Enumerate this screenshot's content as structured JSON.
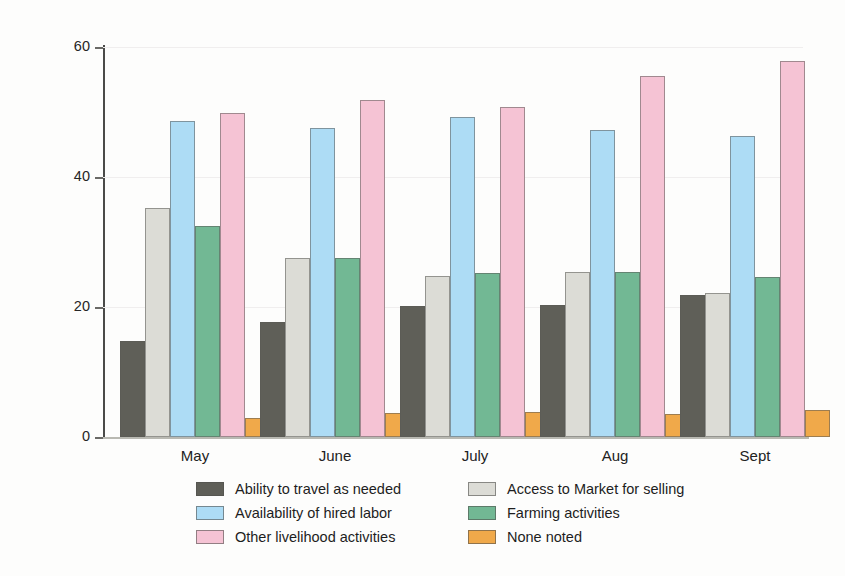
{
  "chart_data": {
    "type": "bar",
    "title": "",
    "subtitle": "",
    "xlabel": "",
    "ylabel": "Percentage of hhs reporting",
    "categories": [
      "May",
      "June",
      "July",
      "Aug",
      "Sept"
    ],
    "ylim": [
      0,
      60
    ],
    "yticks": [
      0,
      20,
      40,
      60
    ],
    "ytick_labels": [
      "0",
      "20",
      "40",
      "60"
    ],
    "grid": true,
    "legend_position": "bottom",
    "series": [
      {
        "name": "Ability to travel as needed",
        "color": "#5f5f58",
        "values": [
          14.8,
          17.7,
          20.2,
          20.3,
          21.9
        ]
      },
      {
        "name": "Access to Market for selling",
        "color": "#dcdcd6",
        "values": [
          35.2,
          27.5,
          24.7,
          25.4,
          22.2
        ]
      },
      {
        "name": "Availability of hired labor",
        "color": "#addcf5",
        "values": [
          48.6,
          47.5,
          49.2,
          47.2,
          46.3
        ]
      },
      {
        "name": "Farming activities",
        "color": "#72b894",
        "values": [
          32.5,
          27.5,
          25.2,
          25.4,
          24.6
        ]
      },
      {
        "name": "Other livelihood activities",
        "color": "#f5c3d4",
        "values": [
          49.8,
          51.8,
          50.7,
          55.5,
          57.8
        ]
      },
      {
        "name": "None noted",
        "color": "#f0a94a",
        "values": [
          2.9,
          3.7,
          3.9,
          3.5,
          4.2
        ]
      }
    ]
  },
  "legend": {
    "items": [
      {
        "label": "Ability to travel as needed",
        "color": "#5f5f58"
      },
      {
        "label": "Access to Market for selling",
        "color": "#dcdcd6"
      },
      {
        "label": "Availability of hired labor",
        "color": "#addcf5"
      },
      {
        "label": "Farming activities",
        "color": "#72b894"
      },
      {
        "label": "Other livelihood activities",
        "color": "#f5c3d4"
      },
      {
        "label": "None noted",
        "color": "#f0a94a"
      }
    ]
  }
}
